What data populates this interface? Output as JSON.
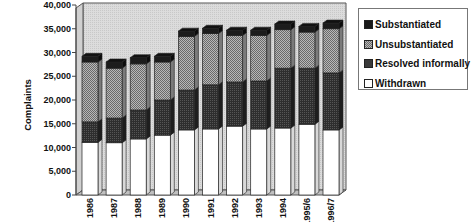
{
  "chart_data": {
    "type": "bar",
    "stacked": true,
    "style": "3d-column",
    "title": "",
    "xlabel": "",
    "ylabel": "Complaints",
    "ylim": [
      0,
      40000
    ],
    "yticks": [
      0,
      5000,
      10000,
      15000,
      20000,
      25000,
      30000,
      35000,
      40000
    ],
    "ytick_labels": [
      "0",
      "5,000",
      "10,000",
      "15,000",
      "20,000",
      "25,000",
      "30,000",
      "35,000",
      "40,000"
    ],
    "grid": false,
    "legend_position": "right",
    "categories": [
      "1986",
      "1987",
      "1988",
      "1989",
      "1990",
      "1991",
      "1992",
      "1993",
      "1994",
      "1995/6",
      "1996/7"
    ],
    "series": [
      {
        "name": "Withdrawn",
        "color": "#ffffff",
        "pattern": "none",
        "values": [
          11100,
          11000,
          11800,
          12600,
          13700,
          13900,
          14500,
          13900,
          14100,
          14900,
          13700
        ]
      },
      {
        "name": "Resolved informally",
        "color": "#3a3a3a",
        "pattern": "dark-dither",
        "values": [
          4300,
          5200,
          6100,
          7400,
          8400,
          9300,
          9300,
          10100,
          12600,
          11800,
          12000
        ]
      },
      {
        "name": "Unsubstantiated",
        "color": "#8e8e8e",
        "pattern": "checker",
        "values": [
          12600,
          10500,
          9700,
          8000,
          11300,
          10800,
          9800,
          9600,
          8100,
          7600,
          9300
        ]
      },
      {
        "name": "Substantiated",
        "color": "#1a1a1a",
        "pattern": "none",
        "values": [
          1200,
          1300,
          1300,
          1200,
          1100,
          1100,
          1100,
          1100,
          1200,
          1200,
          1200
        ]
      }
    ],
    "legend_order": [
      "Substantiated",
      "Unsubstantiated",
      "Resolved informally",
      "Withdrawn"
    ]
  },
  "legend": {
    "items": [
      {
        "label": "Substantiated",
        "swatch": "#1a1a1a"
      },
      {
        "label": "Unsubstantiated",
        "swatch": "#9a9a9a"
      },
      {
        "label": "Resolved informally",
        "swatch": "#3a3a3a"
      },
      {
        "label": "Withdrawn",
        "swatch": "#ffffff"
      }
    ]
  }
}
